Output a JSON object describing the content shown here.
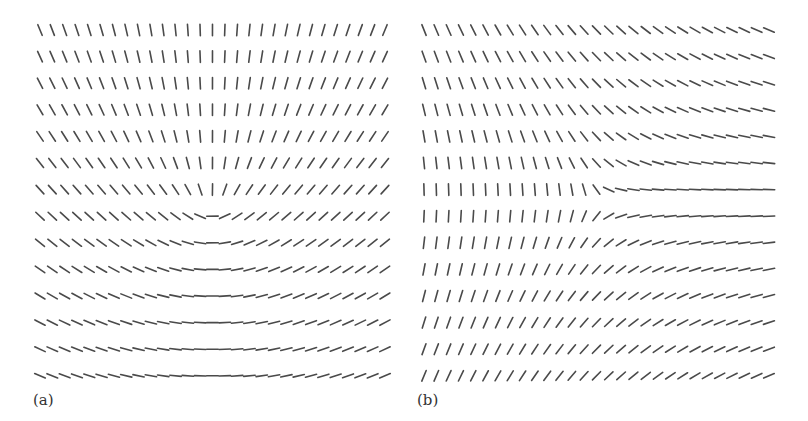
{
  "figure": {
    "stroke_color": "#4a4a4a",
    "stroke_width": 1.6,
    "segment_length": 11.5,
    "panels": [
      {
        "id": "a",
        "label": "(a)",
        "description": "Director field with a +1/2 disclination near the center; director vertical above, horizontal below",
        "grid": {
          "cols": 29,
          "rows": 14,
          "x0": 40,
          "dx": 12.32,
          "y0": 30,
          "dy": 26.6
        },
        "defect": {
          "x": 212,
          "y": 205,
          "charge": 0.5,
          "phase_deg": 45
        }
      },
      {
        "id": "b",
        "label": "(b)",
        "description": "Director field with a half-integer disclination on the right; director horizontal to the right of the core, vertical to the left",
        "grid": {
          "cols": 29,
          "rows": 14,
          "x0": 424,
          "dx": 12.32,
          "y0": 30,
          "dy": 26.6
        },
        "defect": {
          "x": 600,
          "y": 200,
          "charge": -0.5,
          "phase_deg": 0
        }
      }
    ]
  }
}
